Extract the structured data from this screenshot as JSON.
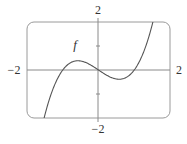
{
  "chart_data": {
    "type": "line",
    "title": "",
    "xlabel": "",
    "ylabel": "",
    "xlim": [
      -2,
      2
    ],
    "ylim": [
      -2,
      2
    ],
    "grid": false,
    "legend": null,
    "tick_labels": {
      "x_min": "−2",
      "x_max": "2",
      "y_min": "−2",
      "y_max": "2"
    },
    "y_ticks": [
      -1,
      1
    ],
    "annotations": [
      {
        "text": "f",
        "x": -0.6,
        "y": 1.0
      }
    ],
    "series": [
      {
        "name": "f",
        "description": "cubic with roots at -1, 0, 1 (f(x) = x^3 - x)",
        "x": [
          -1.53,
          -1.25,
          -1.0,
          -0.75,
          -0.58,
          -0.4,
          -0.2,
          0.0,
          0.2,
          0.4,
          0.58,
          0.75,
          1.0,
          1.25,
          1.53
        ],
        "y": [
          -2.05,
          -0.7,
          0.0,
          0.33,
          0.38,
          0.34,
          0.19,
          0.0,
          -0.19,
          -0.34,
          -0.38,
          -0.33,
          0.0,
          0.7,
          2.05
        ]
      }
    ],
    "colors": {
      "curve": "#555555",
      "axes": "#888888",
      "frame": "#999999",
      "text": "#333333"
    }
  }
}
